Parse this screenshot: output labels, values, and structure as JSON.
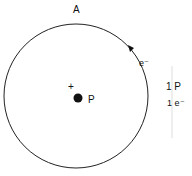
{
  "diagram": {
    "title": "A",
    "nucleus_label": "P",
    "charge_sign": "+",
    "electron_label": "e⁻",
    "legend": {
      "protons": "1 P",
      "electrons": "1 e⁻"
    }
  }
}
